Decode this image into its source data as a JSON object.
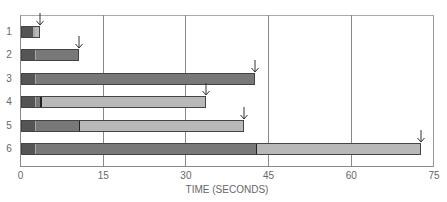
{
  "chart_data": {
    "type": "bar",
    "orientation": "horizontal-stacked",
    "title": "",
    "xlabel": "TIME (SECONDS)",
    "ylabel": "",
    "xlim": [
      0,
      75
    ],
    "xticks": [
      0,
      15,
      30,
      45,
      60,
      75
    ],
    "grid": "vertical",
    "categories": [
      "1",
      "2",
      "3",
      "4",
      "5",
      "6"
    ],
    "colors": {
      "dark": "#555555",
      "medium": "#787878",
      "light": "#b8b8b8",
      "separator_light": "#a8a8a8",
      "separator_dark": "#222222"
    },
    "bars": [
      {
        "label": "1",
        "segments": [
          {
            "start": 0,
            "end": 2.2,
            "shade": "dark"
          },
          {
            "start": 2.2,
            "end": 3.6,
            "shade": "light"
          }
        ],
        "end": 3.6,
        "arrow": true
      },
      {
        "label": "2",
        "segments": [
          {
            "start": 0,
            "end": 2.5,
            "shade": "dark"
          },
          {
            "start": 2.5,
            "end": 10.6,
            "shade": "medium"
          }
        ],
        "end": 10.6,
        "arrow": true
      },
      {
        "label": "3",
        "segments": [
          {
            "start": 0,
            "end": 2.5,
            "shade": "dark"
          },
          {
            "start": 2.5,
            "end": 42.6,
            "shade": "medium"
          }
        ],
        "end": 42.6,
        "arrow": true
      },
      {
        "label": "4",
        "segments": [
          {
            "start": 0,
            "end": 2.5,
            "shade": "dark"
          },
          {
            "start": 2.5,
            "end": 3.5,
            "shade": "medium"
          },
          {
            "start": 3.5,
            "end": 33.7,
            "shade": "light"
          }
        ],
        "end": 33.7,
        "arrow": true
      },
      {
        "label": "5",
        "segments": [
          {
            "start": 0,
            "end": 2.5,
            "shade": "dark"
          },
          {
            "start": 2.5,
            "end": 10.5,
            "shade": "medium"
          },
          {
            "start": 10.5,
            "end": 40.5,
            "shade": "light"
          }
        ],
        "end": 40.5,
        "arrow": true
      },
      {
        "label": "6",
        "segments": [
          {
            "start": 0,
            "end": 2.5,
            "shade": "dark"
          },
          {
            "start": 2.5,
            "end": 42.6,
            "shade": "medium"
          },
          {
            "start": 42.6,
            "end": 72.6,
            "shade": "light"
          }
        ],
        "end": 72.6,
        "arrow": true
      }
    ],
    "legend": null
  }
}
